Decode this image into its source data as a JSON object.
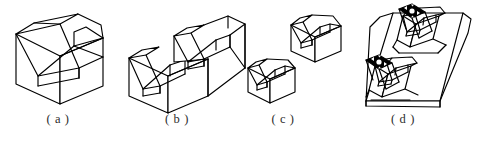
{
  "figure": {
    "kind": "engineering-isometric-line-drawing",
    "background_color": "#ffffff",
    "line_color": "#000000",
    "caption_color": "#2b2b2b",
    "width": 478,
    "height": 141,
    "panels": [
      {
        "id": "a",
        "caption": "( a )",
        "caption_x": 58,
        "caption_y": 112,
        "description": "single large V-block, isometric, wide V groove"
      },
      {
        "id": "b",
        "caption": "( b )",
        "caption_x": 177,
        "caption_y": 112,
        "description": "stepped two-level V-block with two V grooves"
      },
      {
        "id": "c",
        "caption": "( c )",
        "caption_x": 283,
        "caption_y": 112,
        "description": "pair of small matched V-blocks"
      },
      {
        "id": "d",
        "caption": "( d )",
        "caption_x": 403,
        "caption_y": 112,
        "description": "long base plate carrying two V-blocks with shafts seated in the grooves"
      }
    ]
  }
}
